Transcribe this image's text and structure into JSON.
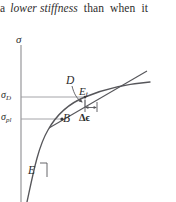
{
  "body_text": {
    "segments": [
      {
        "text": "a",
        "italic": false
      },
      {
        "text": "lower stiffness",
        "italic": true
      },
      {
        "text": "than",
        "italic": false
      },
      {
        "text": "when",
        "italic": false
      },
      {
        "text": "it",
        "italic": false
      }
    ],
    "full": "a lower stiffness than when it"
  },
  "figure": {
    "name": "stress-strain-curve-tangent-modulus",
    "axis": {
      "y_label": "σ",
      "y_label_name": "sigma"
    },
    "labels": {
      "sigma_D": {
        "base": "σ",
        "sub": "D"
      },
      "sigma_pl": {
        "base": "σ",
        "sub": "pl"
      },
      "point_D": "D",
      "tangent_modulus": {
        "base": "E",
        "sub": "t"
      },
      "point_B": "B",
      "delta_epsilon": "Δϵ",
      "elastic_modulus": "E"
    },
    "colors": {
      "curve": "#56565a",
      "tangent": "#56565a",
      "axis": "#8d8d91",
      "guide_line": "#9a9a9e",
      "text": "#2b2b2b"
    },
    "geometry": {
      "axis_x": 21,
      "axis_top_y": 21,
      "axis_bottom_y": 178,
      "sigma_D_y": 73,
      "sigma_pl_y": 95,
      "point_D_x": 85,
      "point_B_x": 62,
      "delta_epsilon_span": [
        85,
        97
      ]
    }
  }
}
